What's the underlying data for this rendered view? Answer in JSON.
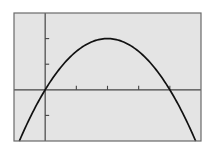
{
  "chart_data": {
    "type": "line",
    "title": "",
    "xlabel": "",
    "ylabel": "",
    "function": "y = -0.5x^2 + 2x",
    "xlim": [
      -1,
      5
    ],
    "ylim": [
      -2,
      3
    ],
    "x_ticks": [
      1,
      2,
      3,
      4
    ],
    "y_ticks": [
      -1,
      1,
      2
    ],
    "grid": false,
    "legend": null,
    "series": [
      {
        "name": "parabola",
        "x": [
          -0.83,
          -0.5,
          0,
          0.5,
          1,
          1.5,
          2,
          2.5,
          3,
          3.5,
          4,
          4.5,
          4.83
        ],
        "values": [
          -2,
          -1.125,
          0,
          0.875,
          1.5,
          1.875,
          2,
          1.875,
          1.5,
          0.875,
          0,
          -1.125,
          -2
        ]
      }
    ],
    "annotations": {
      "vertex": [
        2,
        2
      ],
      "roots": [
        0,
        4
      ]
    }
  },
  "colors": {
    "background": "#ffffff",
    "plot_fill": "#e4e4e4",
    "frame": "#6a6a6a",
    "axis": "#444444",
    "curve": "#111111"
  }
}
